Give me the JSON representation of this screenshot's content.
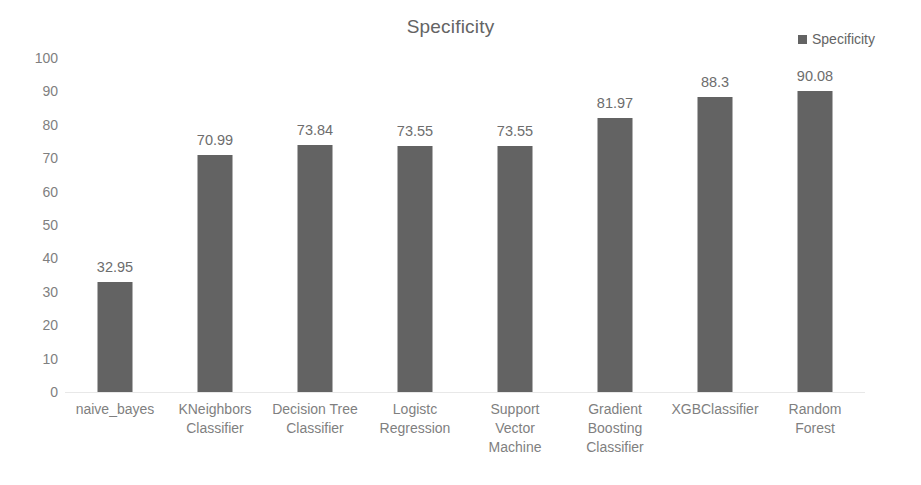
{
  "chart_data": {
    "type": "bar",
    "title": "Specificity",
    "xlabel": "",
    "ylabel": "",
    "ylim": [
      0,
      100
    ],
    "yticks": [
      "100",
      "90",
      "80",
      "70",
      "60",
      "50",
      "40",
      "30",
      "20",
      "10",
      "0"
    ],
    "grid": false,
    "legend": {
      "position": "top-right",
      "entries": [
        {
          "name": "Specificity",
          "color": "#636363"
        }
      ]
    },
    "series": [
      {
        "name": "Specificity",
        "color": "#636363",
        "values": [
          32.95,
          70.99,
          73.84,
          73.55,
          73.55,
          81.97,
          88.3,
          90.08
        ]
      }
    ],
    "categories": [
      "naive_bayes",
      "KNeighbors\nClassifier",
      "Decision Tree\nClassifier",
      "Logistc\nRegression",
      "Support\nVector\nMachine",
      "Gradient\nBoosting\nClassifier",
      "XGBClassifier",
      "Random\nForest"
    ],
    "data_labels": [
      "32.95",
      "70.99",
      "73.84",
      "73.55",
      "73.55",
      "81.97",
      "88.3",
      "90.08"
    ]
  },
  "colors": {
    "bar": "#636363",
    "axis_text": "#7f7f7f",
    "title_text": "#646464",
    "background": "#ffffff"
  }
}
